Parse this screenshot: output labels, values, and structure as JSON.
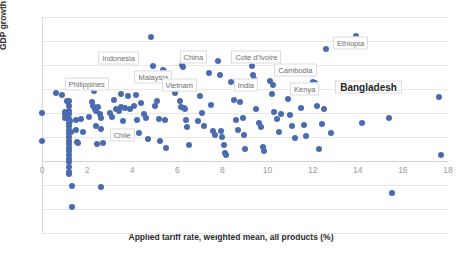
{
  "chart_data": {
    "type": "scatter",
    "title": "",
    "xlabel": "Applied tariff rate, weighted mean, all products (%)",
    "ylabel": "GDP growth (Avg 2000-18, %)",
    "xlim": [
      0,
      18
    ],
    "ylim": [
      -6,
      12
    ],
    "xticks": [
      0,
      2,
      4,
      6,
      8,
      10,
      12,
      14,
      16,
      18
    ],
    "yticks": [
      -6,
      -4,
      -2,
      0,
      2,
      4,
      6,
      8,
      10,
      12
    ],
    "grid": true,
    "legend": "none",
    "marker_color": "#4a6bb0",
    "series": [
      {
        "name": "Countries",
        "points": [
          [
            0.0,
            4.0
          ],
          [
            0.0,
            1.7
          ],
          [
            0.6,
            5.7
          ],
          [
            0.9,
            5.5
          ],
          [
            1.0,
            4.1
          ],
          [
            1.0,
            3.9
          ],
          [
            1.0,
            3.6
          ],
          [
            1.1,
            5.0
          ],
          [
            1.15,
            4.9
          ],
          [
            1.2,
            5.0
          ],
          [
            1.2,
            4.6
          ],
          [
            1.2,
            4.2
          ],
          [
            1.2,
            3.9
          ],
          [
            1.2,
            3.5
          ],
          [
            1.2,
            3.2
          ],
          [
            1.2,
            2.9
          ],
          [
            1.2,
            2.6
          ],
          [
            1.2,
            2.3
          ],
          [
            1.2,
            2.0
          ],
          [
            1.2,
            1.7
          ],
          [
            1.2,
            1.4
          ],
          [
            1.2,
            1.1
          ],
          [
            1.2,
            0.8
          ],
          [
            1.2,
            0.5
          ],
          [
            1.2,
            0.2
          ],
          [
            1.2,
            -0.1
          ],
          [
            1.2,
            -0.5
          ],
          [
            1.2,
            -0.9
          ],
          [
            1.2,
            -1.1
          ],
          [
            1.25,
            3.3
          ],
          [
            1.3,
            2.4
          ],
          [
            1.35,
            -2.1
          ],
          [
            1.35,
            -3.8
          ],
          [
            1.5,
            3.4
          ],
          [
            1.5,
            2.6
          ],
          [
            1.55,
            1.6
          ],
          [
            1.6,
            1.5
          ],
          [
            1.75,
            3.5
          ],
          [
            1.8,
            2.4
          ],
          [
            2.1,
            3.7
          ],
          [
            2.2,
            4.9
          ],
          [
            2.25,
            4.6
          ],
          [
            2.3,
            5.8
          ],
          [
            2.35,
            4.3
          ],
          [
            2.4,
            4.2
          ],
          [
            2.4,
            2.9
          ],
          [
            2.45,
            1.4
          ],
          [
            2.5,
            4.5
          ],
          [
            2.55,
            3.9
          ],
          [
            2.6,
            3.6
          ],
          [
            2.6,
            2.7
          ],
          [
            2.6,
            -2.2
          ],
          [
            2.7,
            1.5
          ],
          [
            3.0,
            4.0
          ],
          [
            3.1,
            3.7
          ],
          [
            3.2,
            5.1
          ],
          [
            3.3,
            4.3
          ],
          [
            3.4,
            4.2
          ],
          [
            3.5,
            5.6
          ],
          [
            3.5,
            4.5
          ],
          [
            3.6,
            3.3
          ],
          [
            3.7,
            4.4
          ],
          [
            3.8,
            5.4
          ],
          [
            3.9,
            4.3
          ],
          [
            4.1,
            4.6
          ],
          [
            4.15,
            5.5
          ],
          [
            4.2,
            3.4
          ],
          [
            4.3,
            2.3
          ],
          [
            4.4,
            4.8
          ],
          [
            4.5,
            3.9
          ],
          [
            4.6,
            3.6
          ],
          [
            4.7,
            1.8
          ],
          [
            4.85,
            10.3
          ],
          [
            4.9,
            7.9
          ],
          [
            5.0,
            4.6
          ],
          [
            5.1,
            5.0
          ],
          [
            5.2,
            3.5
          ],
          [
            5.25,
            1.7
          ],
          [
            5.35,
            7.6
          ],
          [
            5.4,
            7.5
          ],
          [
            5.45,
            3.4
          ],
          [
            5.5,
            1.1
          ],
          [
            5.9,
            5.7
          ],
          [
            6.0,
            6.1
          ],
          [
            6.1,
            5.0
          ],
          [
            6.15,
            4.5
          ],
          [
            6.2,
            8.0
          ],
          [
            6.25,
            7.8
          ],
          [
            6.3,
            4.4
          ],
          [
            6.35,
            4.3
          ],
          [
            6.4,
            3.4
          ],
          [
            6.45,
            2.8
          ],
          [
            6.5,
            1.3
          ],
          [
            6.9,
            3.3
          ],
          [
            7.0,
            5.4
          ],
          [
            7.1,
            4.0
          ],
          [
            7.2,
            2.9
          ],
          [
            7.4,
            7.3
          ],
          [
            7.5,
            4.7
          ],
          [
            7.6,
            2.5
          ],
          [
            7.65,
            2.2
          ],
          [
            7.8,
            8.3
          ],
          [
            7.9,
            7.2
          ],
          [
            7.95,
            2.5
          ],
          [
            8.0,
            2.0
          ],
          [
            8.05,
            1.3
          ],
          [
            8.1,
            0.7
          ],
          [
            8.15,
            0.5
          ],
          [
            8.4,
            6.6
          ],
          [
            8.5,
            5.1
          ],
          [
            8.6,
            3.4
          ],
          [
            8.7,
            2.6
          ],
          [
            8.8,
            4.9
          ],
          [
            8.9,
            3.6
          ],
          [
            8.95,
            2.2
          ],
          [
            9.0,
            1.0
          ],
          [
            9.3,
            7.9
          ],
          [
            9.35,
            7.2
          ],
          [
            9.4,
            6.8
          ],
          [
            9.5,
            4.3
          ],
          [
            9.6,
            3.2
          ],
          [
            9.7,
            2.8
          ],
          [
            9.8,
            1.2
          ],
          [
            9.85,
            0.8
          ],
          [
            10.1,
            6.7
          ],
          [
            10.2,
            5.6
          ],
          [
            10.25,
            6.3
          ],
          [
            10.3,
            4.1
          ],
          [
            10.4,
            3.5
          ],
          [
            10.5,
            2.4
          ],
          [
            10.6,
            3.9
          ],
          [
            10.9,
            5.2
          ],
          [
            11.0,
            3.8
          ],
          [
            11.1,
            2.9
          ],
          [
            11.2,
            1.9
          ],
          [
            11.5,
            4.4
          ],
          [
            11.6,
            3.0
          ],
          [
            11.7,
            2.1
          ],
          [
            12.0,
            6.6
          ],
          [
            12.05,
            6.4
          ],
          [
            12.1,
            6.5
          ],
          [
            12.2,
            4.6
          ],
          [
            12.3,
            1.0
          ],
          [
            12.4,
            3.1
          ],
          [
            12.5,
            4.3
          ],
          [
            12.6,
            9.3
          ],
          [
            12.8,
            2.3
          ],
          [
            13.9,
            10.4
          ],
          [
            14.2,
            3.2
          ],
          [
            15.4,
            3.6
          ],
          [
            15.5,
            -2.7
          ],
          [
            17.6,
            5.3
          ],
          [
            17.7,
            0.5
          ]
        ]
      }
    ],
    "annotations": [
      {
        "text": "Indonesia",
        "x": 2.5,
        "y": 8.6,
        "emphasis": "normal"
      },
      {
        "text": "Philippines",
        "x": 1.0,
        "y": 6.4,
        "emphasis": "normal"
      },
      {
        "text": "Malaysia",
        "x": 4.1,
        "y": 7.0,
        "emphasis": "normal"
      },
      {
        "text": "Vietnam",
        "x": 5.3,
        "y": 6.3,
        "emphasis": "normal"
      },
      {
        "text": "China",
        "x": 6.1,
        "y": 8.7,
        "emphasis": "normal"
      },
      {
        "text": "Cote d'Ivoire",
        "x": 8.4,
        "y": 8.7,
        "emphasis": "normal"
      },
      {
        "text": "India",
        "x": 8.5,
        "y": 6.3,
        "emphasis": "normal"
      },
      {
        "text": "Cambodia",
        "x": 10.3,
        "y": 7.6,
        "emphasis": "normal"
      },
      {
        "text": "Kenya",
        "x": 11.0,
        "y": 6.0,
        "emphasis": "normal"
      },
      {
        "text": "Ethiopia",
        "x": 12.9,
        "y": 9.8,
        "emphasis": "normal"
      },
      {
        "text": "Bangladesh",
        "x": 13.0,
        "y": 6.2,
        "emphasis": "big"
      },
      {
        "text": "Chile",
        "x": 3.0,
        "y": 2.2,
        "emphasis": "normal"
      }
    ]
  }
}
